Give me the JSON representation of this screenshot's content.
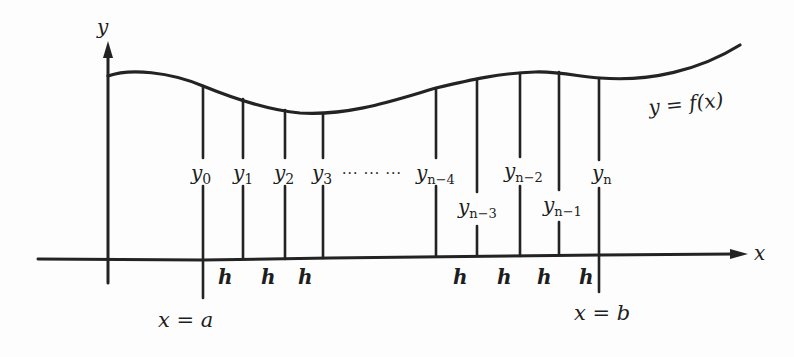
{
  "diagram": {
    "colors": {
      "ink": "#232323",
      "background": "#fdfdfd"
    },
    "axes": {
      "y_label": "y",
      "x_label": "x"
    },
    "curve": {
      "label": "y = f(x)"
    },
    "bounds": {
      "left": "x = a",
      "right": "x = b"
    },
    "ordinates": [
      {
        "base": "y",
        "sub": "0"
      },
      {
        "base": "y",
        "sub": "1"
      },
      {
        "base": "y",
        "sub": "2"
      },
      {
        "base": "y",
        "sub": "3"
      },
      {
        "base": "y",
        "sub": "n−4"
      },
      {
        "base": "y",
        "sub": "n−3"
      },
      {
        "base": "y",
        "sub": "n−2"
      },
      {
        "base": "y",
        "sub": "n−1"
      },
      {
        "base": "y",
        "sub": "n"
      }
    ],
    "ellipsis": "··· ··· ···",
    "step_label": "h",
    "steps": [
      "h",
      "h",
      "h",
      "h",
      "h",
      "h",
      "h"
    ]
  }
}
